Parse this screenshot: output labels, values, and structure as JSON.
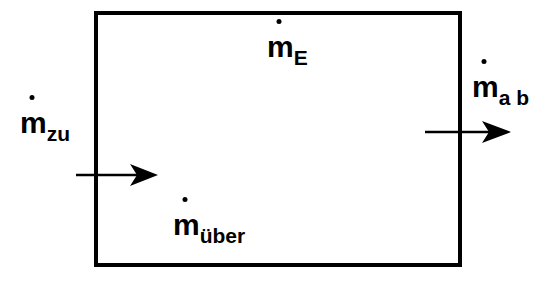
{
  "diagram": {
    "background_color": "#ffffff",
    "stroke_color": "#000000",
    "control_volume": {
      "name": "control-volume",
      "shape": "rectangle",
      "border_width_px": 4,
      "x": 94,
      "y": 11,
      "width": 368,
      "height": 256
    },
    "labels": [
      {
        "id": "zu",
        "base": "m",
        "subscript": "zu",
        "overdot": true,
        "meaning": "inlet mass flow rate",
        "x": 20,
        "y": 108
      },
      {
        "id": "E",
        "base": "m",
        "subscript": "E",
        "overdot": true,
        "meaning": "stored mass flow rate",
        "x": 267,
        "y": 32
      },
      {
        "id": "ab",
        "base": "m",
        "subscript": "a b",
        "overdot": true,
        "meaning": "outlet mass flow rate",
        "x": 472,
        "y": 72
      },
      {
        "id": "ueber",
        "base": "m",
        "subscript": "über",
        "overdot": true,
        "meaning": "transferred mass flow rate",
        "x": 173,
        "y": 210
      }
    ],
    "arrows": [
      {
        "id": "inlet-arrow",
        "direction": "right",
        "x1": 76,
        "y1": 175,
        "x2": 158,
        "y2": 175,
        "crosses_boundary": true
      },
      {
        "id": "outlet-arrow",
        "direction": "right",
        "x1": 425,
        "y1": 132,
        "x2": 511,
        "y2": 132,
        "crosses_boundary": true
      }
    ]
  }
}
